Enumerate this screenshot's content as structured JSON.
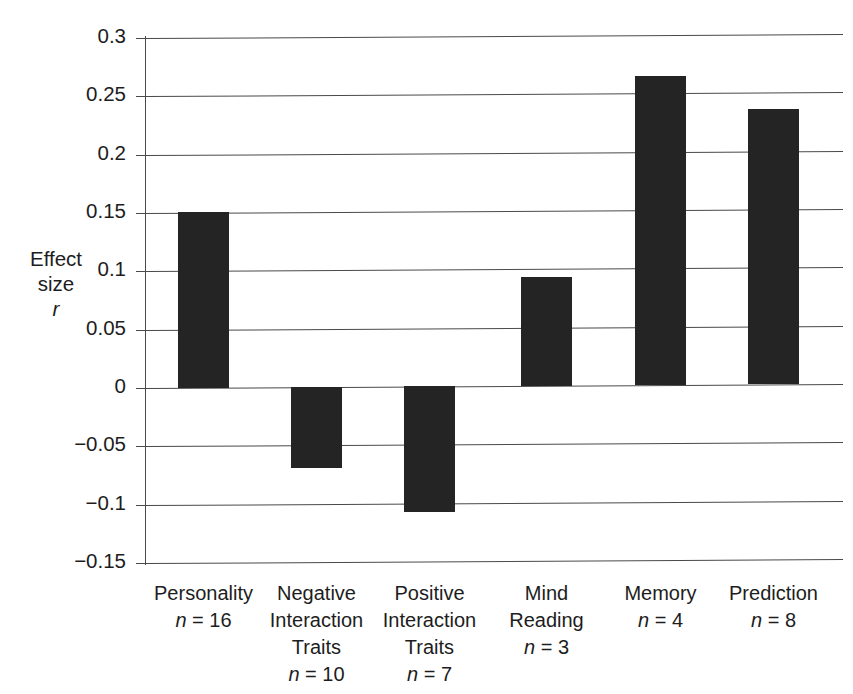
{
  "chart_data": {
    "type": "bar",
    "title": "",
    "xlabel": "",
    "ylabel": "Effect size r",
    "ylim": [
      -0.15,
      0.3
    ],
    "ytick_values": [
      0.3,
      0.25,
      0.2,
      0.15,
      0.1,
      0.05,
      0,
      -0.05,
      -0.1,
      -0.15
    ],
    "ytick_labels": [
      "0.3",
      "0.25",
      "0.2",
      "0.15",
      "0.1",
      "0.05",
      "0",
      "−0.05",
      "−0.1",
      "−0.15"
    ],
    "grid": true,
    "legend": "none",
    "bar_color": "#242424",
    "categories": [
      "Personality",
      "Negative Interaction Traits",
      "Positive Interaction Traits",
      "Mind Reading",
      "Memory",
      "Prediction"
    ],
    "values": [
      0.151,
      -0.069,
      -0.108,
      0.093,
      0.265,
      0.236
    ],
    "sample_sizes": [
      16,
      10,
      7,
      3,
      4,
      8
    ]
  },
  "axis_title": {
    "line1": "Effect",
    "line2": "size",
    "line3": "r"
  },
  "ytick_labels": [
    "0.3",
    "0.25",
    "0.2",
    "0.15",
    "0.1",
    "0.05",
    "0",
    "−0.05",
    "−0.1",
    "−0.15"
  ],
  "categories": [
    {
      "name_lines": [
        "Personality"
      ],
      "n_prefix": "n",
      "n_text": " = 16"
    },
    {
      "name_lines": [
        "Negative",
        "Interaction",
        "Traits"
      ],
      "n_prefix": "n",
      "n_text": " = 10"
    },
    {
      "name_lines": [
        "Positive",
        "Interaction",
        "Traits"
      ],
      "n_prefix": "n",
      "n_text": " = 7"
    },
    {
      "name_lines": [
        "Mind",
        "Reading"
      ],
      "n_prefix": "n",
      "n_text": " = 3"
    },
    {
      "name_lines": [
        "Memory"
      ],
      "n_prefix": "n",
      "n_text": " = 4"
    },
    {
      "name_lines": [
        "Prediction"
      ],
      "n_prefix": "n",
      "n_text": " = 8"
    }
  ]
}
